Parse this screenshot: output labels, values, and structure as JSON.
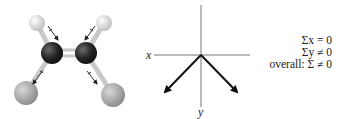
{
  "figure": {
    "molecule": {
      "name": "cis-dichloroethene model",
      "atoms": [
        {
          "element": "H",
          "x": 37,
          "y": 23,
          "r": 8,
          "color": "#e8e8e8"
        },
        {
          "element": "H",
          "x": 104,
          "y": 23,
          "r": 8,
          "color": "#e8e8e8"
        },
        {
          "element": "C",
          "x": 52,
          "y": 53,
          "r": 11,
          "color": "#2a2a2a"
        },
        {
          "element": "C",
          "x": 86,
          "y": 53,
          "r": 11,
          "color": "#2a2a2a"
        },
        {
          "element": "Cl",
          "x": 26,
          "y": 93,
          "r": 12,
          "color": "#a9a9a9"
        },
        {
          "element": "Cl",
          "x": 113,
          "y": 95,
          "r": 12,
          "color": "#a9a9a9"
        }
      ]
    },
    "axes": {
      "x_label": "x",
      "y_label": "y"
    },
    "summary": {
      "line1": "Σx = 0",
      "line2": "Σy ≠ 0",
      "line3": "overall: Σ ≠ 0"
    }
  }
}
